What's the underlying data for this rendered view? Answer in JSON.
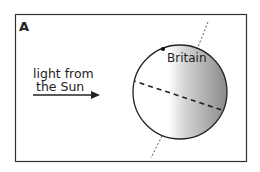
{
  "panel": {
    "label": "A",
    "light_text_line1": "light from",
    "light_text_line2": "the Sun",
    "location_label": "Britain"
  },
  "colors": {
    "frame": "#333333",
    "ink": "#222222",
    "shadow": "#8a8a8a",
    "background": "#ffffff"
  }
}
